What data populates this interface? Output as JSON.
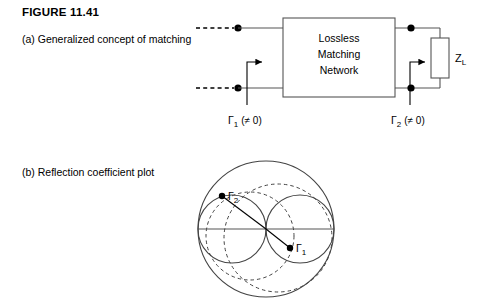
{
  "figure": {
    "title": "FIGURE 11.41",
    "caption_a": "(a) Generalized concept of matching",
    "caption_b": "(b) Reflection coefficient plot"
  },
  "circuit": {
    "block": {
      "line1": "Lossless",
      "line2": "Matching",
      "line3": "Network"
    },
    "load_label": "Z",
    "load_sub": "L",
    "port1": {
      "gamma": "Γ",
      "sub": "1",
      "condition": "(≠ 0)"
    },
    "port2": {
      "gamma": "Γ",
      "sub": "2",
      "condition": "(≠ 0)"
    }
  },
  "smith": {
    "point1": {
      "gamma": "Γ",
      "sub": "1"
    },
    "point2": {
      "gamma": "Γ",
      "sub": "2"
    }
  },
  "colors": {
    "ink": "#000000",
    "line": "#3a3a3a",
    "background": "#ffffff"
  }
}
